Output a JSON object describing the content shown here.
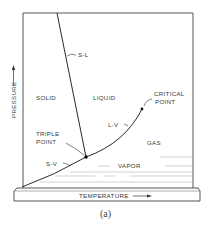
{
  "diagram": {
    "caption": "(a)",
    "axes": {
      "x_label": "TEMPERATURE",
      "y_label": "PRESSURE"
    },
    "regions": {
      "solid": "SOLID",
      "liquid": "LIQUID",
      "gas": "GAS",
      "vapor": "VAPOR"
    },
    "curves": {
      "solid_liquid": "S-L",
      "liquid_vapor": "L-V",
      "solid_vapor": "S-V"
    },
    "points": {
      "triple_line1": "TRIPLE",
      "triple_line2": "POINT",
      "critical_line1": "CRITICAL",
      "critical_line2": "POINT"
    },
    "colors": {
      "line": "#2a2a2a",
      "frame": "#555555",
      "text": "#3a3a3a",
      "background": "#ffffff"
    }
  }
}
